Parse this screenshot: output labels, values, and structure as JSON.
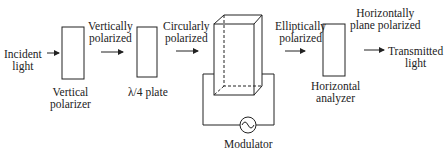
{
  "diagram": {
    "labels": {
      "incident": [
        "Incident",
        "light"
      ],
      "vertically_polarized": [
        "Vertically",
        "polarized"
      ],
      "circularly_polarized": [
        "Circularly",
        "polarized"
      ],
      "elliptically_polarized": [
        "Elliptically",
        "polarized"
      ],
      "horizontally_plane_polarized": [
        "Horizontally",
        "plane polarized"
      ],
      "transmitted": [
        "Transmitted",
        "light"
      ],
      "vertical_polarizer": [
        "Vertical",
        "polarizer"
      ],
      "quarter_wave_plate": "λ/4 plate",
      "horizontal_analyzer": [
        "Horizontal",
        "analyzer"
      ],
      "modulator": "Modulator"
    }
  }
}
